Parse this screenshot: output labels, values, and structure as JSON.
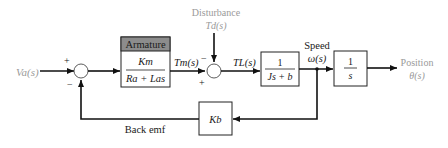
{
  "diagram": {
    "type": "block-diagram",
    "input": {
      "label": "V_a(s)",
      "display": "Va(s)"
    },
    "output": {
      "label": "Position",
      "signal": "θ(s)"
    },
    "disturbance": {
      "label": "Disturbance",
      "signal": "Td(s)"
    },
    "summing_junction_1": {
      "plus_sign": "+",
      "minus_sign": "−"
    },
    "summing_junction_2": {
      "plus_sign": "+",
      "minus_sign": "−"
    },
    "blocks": {
      "armature": {
        "header": "Armature",
        "numerator": "Km",
        "denominator": "Ra + Las"
      },
      "load": {
        "numerator": "1",
        "denominator": "Js + b"
      },
      "integrator": {
        "numerator": "1",
        "denominator": "s"
      },
      "back_emf_gain": {
        "label": "Kb"
      }
    },
    "signals": {
      "motor_torque": "Tm(s)",
      "load_torque": "TL(s)",
      "speed_label": "Speed",
      "speed_signal": "ω(s)",
      "feedback_label": "Back emf"
    }
  }
}
